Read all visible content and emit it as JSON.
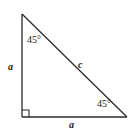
{
  "figure": {
    "type": "right-isosceles-triangle-diagram",
    "background_color": "#ffffff",
    "stroke_color": "#2b2b2b",
    "text_color": "#1a1a1a",
    "geometry": {
      "apex": {
        "x": 22,
        "y": 14
      },
      "right_angle_vertex": {
        "x": 22,
        "y": 117
      },
      "bottom_right_vertex": {
        "x": 127,
        "y": 117
      },
      "right_angle_marker": {
        "x": 22,
        "y": 110,
        "size": 7
      }
    },
    "labels": {
      "angle_top": "45°",
      "angle_bottom_right": "45°",
      "side_left": "a",
      "side_hypotenuse": "c",
      "side_bottom": "a"
    }
  }
}
